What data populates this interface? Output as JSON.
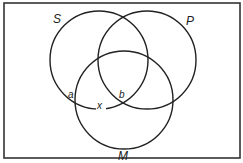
{
  "diagram": {
    "type": "venn",
    "sets": [
      {
        "id": "S",
        "label": "S"
      },
      {
        "id": "P",
        "label": "P"
      },
      {
        "id": "M",
        "label": "M"
      }
    ],
    "points": [
      {
        "id": "a",
        "label": "a"
      },
      {
        "id": "b",
        "label": "b"
      },
      {
        "id": "x",
        "label": "x"
      }
    ],
    "colors": {
      "stroke": "#222222",
      "background": "#ffffff",
      "frame": "#333333"
    }
  }
}
